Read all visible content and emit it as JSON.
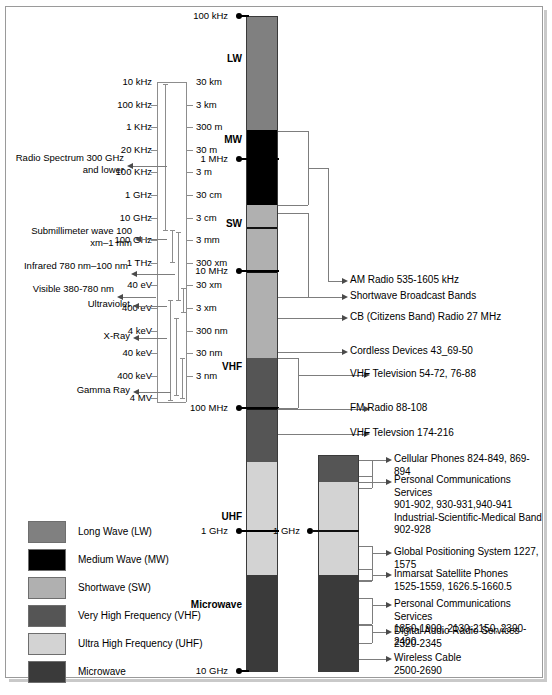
{
  "spectrum_bar": {
    "name": "main-spectrum-bar",
    "top_label": "100 kHz",
    "bottom_label": "10 GHz",
    "bands": [
      {
        "id": "lw",
        "label": "LW",
        "color": "#808080",
        "top": 16,
        "height": 114
      },
      {
        "id": "mw",
        "label": "MW",
        "color": "#000000",
        "top": 130,
        "height": 75
      },
      {
        "id": "sw",
        "label": "SW",
        "color": "#b0b0b0",
        "top": 205,
        "height": 153
      },
      {
        "id": "vhf",
        "label": "VHF",
        "color": "#555555",
        "top": 358,
        "height": 104
      },
      {
        "id": "uhf",
        "label": "UHF",
        "color": "#d3d3d3",
        "top": 462,
        "height": 113
      },
      {
        "id": "microwave",
        "label": "Microwave",
        "color": "#3a3a3a",
        "top": 575,
        "height": 97
      }
    ],
    "ticks": [
      {
        "label": "100 kHz",
        "y": 16,
        "long": false
      },
      {
        "label": "1 MHz",
        "y": 159,
        "long": true
      },
      {
        "label": "10 MHz",
        "y": 271,
        "long": true
      },
      {
        "label": "100 MHz",
        "y": 408,
        "long": true
      },
      {
        "label": "1 GHz",
        "y": 531,
        "long": true
      },
      {
        "label": "10 GHz",
        "y": 671,
        "long": false
      }
    ],
    "inner_rules": [
      {
        "y": 227
      },
      {
        "y": 271
      },
      {
        "y": 408
      }
    ],
    "band_name_positions": [
      {
        "label": "LW",
        "y": 53
      },
      {
        "label": "MW",
        "y": 134
      },
      {
        "label": "SW",
        "y": 218
      },
      {
        "label": "VHF",
        "y": 361
      },
      {
        "label": "UHF",
        "y": 511
      },
      {
        "label": "Microwave",
        "y": 599
      }
    ]
  },
  "inset_bar": {
    "name": "uhf-microwave-inset-bar",
    "tick_label": "1 GHz",
    "tick_y": 531,
    "segments": [
      {
        "id": "inset-vhf",
        "color": "#555555",
        "top": 455,
        "height": 27
      },
      {
        "id": "inset-uhf1",
        "color": "#d3d3d3",
        "top": 482,
        "height": 49
      },
      {
        "id": "inset-uhf2",
        "color": "#d3d3d3",
        "top": 531,
        "height": 44
      },
      {
        "id": "inset-mw",
        "color": "#3a3a3a",
        "top": 575,
        "height": 97
      }
    ]
  },
  "ladder": {
    "name": "frequency-wavelength-ladder",
    "frequency_ticks": [
      "10 kHz",
      "100 kHz",
      "1 KHz",
      "20 KHz",
      "100 KHz",
      "1 GHz",
      "10 GHz",
      "100 GHz",
      "1 THz",
      "40 eV",
      "400 eV",
      "4 keV",
      "40 keV",
      "400 keV",
      "4 MV"
    ],
    "wavelength_ticks": [
      "30 km",
      "3 km",
      "300 m",
      "30 m",
      "3 m",
      "30 cm",
      "3 cm",
      "3 mm",
      "300 xm",
      "30 xm",
      "3 xm",
      "300 nm",
      "30 nm",
      "3 nm"
    ]
  },
  "regions": [
    {
      "id": "radio",
      "text": "Radio Spectrum\n300 GHz and\nlower"
    },
    {
      "id": "submillimeter",
      "text": "Submillimeter wave\n100 xm–1 mm"
    },
    {
      "id": "infrared",
      "text": "Infrared\n780 nm–100 nm"
    },
    {
      "id": "visible",
      "text": "Visible\n380-780 nm"
    },
    {
      "id": "ultraviolet",
      "text": "Ultraviolet"
    },
    {
      "id": "xray",
      "text": "X-Ray"
    },
    {
      "id": "gamma",
      "text": "Gamma Ray"
    }
  ],
  "legend": {
    "name": "band-color-legend",
    "items": [
      {
        "label": "Long Wave (LW)",
        "color": "#808080"
      },
      {
        "label": "Medium Wave (MW)",
        "color": "#000000"
      },
      {
        "label": "Shortwave (SW)",
        "color": "#b0b0b0"
      },
      {
        "label": "Very High Frequency (VHF)",
        "color": "#555555"
      },
      {
        "label": "Ultra High Frequency (UHF)",
        "color": "#d3d3d3"
      },
      {
        "label": "Microwave",
        "color": "#3a3a3a"
      }
    ]
  },
  "callouts": [
    {
      "id": "am-radio",
      "text": "AM Radio 535-1605 kHz",
      "y": 281
    },
    {
      "id": "swbc",
      "text": "Shortwave Broadcast Bands",
      "y": 297
    },
    {
      "id": "cb-radio",
      "text": "CB (Citizens Band) Radio 27 MHz",
      "y": 318
    },
    {
      "id": "cordless",
      "text": "Cordless Devices 43_69-50",
      "y": 352
    },
    {
      "id": "vhf-tv-low",
      "text": "VHF Television 54-72, 76-88",
      "y": 375
    },
    {
      "id": "fm-radio",
      "text": "FM Radio 88-108",
      "y": 409
    },
    {
      "id": "vhf-tv-high",
      "text": "VHF Televsion 174-216",
      "y": 434
    },
    {
      "id": "cellular",
      "text": "Cellular Phones 824-849, 869-894",
      "y": 460
    },
    {
      "id": "pcs-900",
      "text": "Personal Communications Services\n901-902, 930-931,940-941\nIndustrial-Scientific-Medical Band\n902-928",
      "y": 481
    },
    {
      "id": "gps",
      "text": "Global Positioning System 1227, 1575",
      "y": 553
    },
    {
      "id": "inmarsat",
      "text": "Inmarsat Satellite Phones\n1525-1559, 1626.5-1660.5",
      "y": 575
    },
    {
      "id": "pcs-1900",
      "text": "Personal Communications Services\n1850-1990, 2130-2150, 2390-2400",
      "y": 605
    },
    {
      "id": "dars",
      "text": "Digital Audio Radio Services\n2320-2345",
      "y": 632
    },
    {
      "id": "wireless",
      "text": "Wireless Cable\n2500-2690",
      "y": 659
    }
  ]
}
